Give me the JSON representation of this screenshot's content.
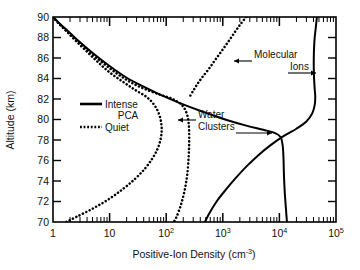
{
  "chart_data": {
    "type": "line",
    "title": "",
    "subtitle": "",
    "xlabel": "Positive-Ion Density (cm",
    "xlabel_unit_sup": "-3",
    "xlabel_tail": ")",
    "ylabel": "Altitude (km)",
    "xscale": "log",
    "yscale": "linear",
    "xlim": [
      1,
      100000
    ],
    "ylim": [
      70,
      90
    ],
    "grid": false,
    "xticks": [
      {
        "value": 1,
        "label": "1",
        "sup": ""
      },
      {
        "value": 10,
        "label": "10",
        "sup": ""
      },
      {
        "value": 100,
        "label": "10",
        "sup": "2"
      },
      {
        "value": 1000,
        "label": "10",
        "sup": "3"
      },
      {
        "value": 10000,
        "label": "10",
        "sup": "4"
      },
      {
        "value": 100000,
        "label": "10",
        "sup": "5"
      }
    ],
    "yticks": [
      {
        "value": 70,
        "label": "70"
      },
      {
        "value": 72,
        "label": "72"
      },
      {
        "value": 74,
        "label": "74"
      },
      {
        "value": 76,
        "label": "76"
      },
      {
        "value": 78,
        "label": "78"
      },
      {
        "value": 80,
        "label": "80"
      },
      {
        "value": 82,
        "label": "82"
      },
      {
        "value": 84,
        "label": "84"
      },
      {
        "value": 86,
        "label": "86"
      },
      {
        "value": 88,
        "label": "88"
      },
      {
        "value": 90,
        "label": "90"
      }
    ],
    "legend": {
      "position": "inside-left",
      "entries": [
        {
          "name": "Intense PCA",
          "line1": "Intense",
          "line2": "PCA",
          "style": "solid"
        },
        {
          "name": "Quiet",
          "line1": "Quiet",
          "line2": "",
          "style": "dotted"
        }
      ]
    },
    "annotations": [
      {
        "name": "Molecular Ions",
        "line1": "Molecular",
        "line2": "Ions"
      },
      {
        "name": "Water Clusters",
        "line1": "Water",
        "line2": "Clusters"
      }
    ],
    "series": [
      {
        "name": "Quiet - Water Clusters",
        "style": "dotted",
        "points": [
          [
            1.0,
            90.0
          ],
          [
            1.25,
            89.4
          ],
          [
            1.7,
            88.7
          ],
          [
            2.4,
            87.9
          ],
          [
            3.6,
            87.0
          ],
          [
            5.6,
            86.1
          ],
          [
            9.0,
            85.2
          ],
          [
            15.0,
            84.3
          ],
          [
            26.0,
            83.5
          ],
          [
            45.0,
            82.9
          ],
          [
            80.0,
            82.4
          ],
          [
            130.0,
            82.0
          ],
          [
            190.0,
            81.4
          ],
          [
            230.0,
            80.6
          ],
          [
            250.0,
            79.6
          ],
          [
            255.0,
            78.2
          ],
          [
            250.0,
            76.5
          ],
          [
            235.0,
            74.6
          ],
          [
            210.0,
            73.0
          ],
          [
            180.0,
            71.6
          ],
          [
            150.0,
            70.4
          ],
          [
            135.0,
            70.0
          ]
        ]
      },
      {
        "name": "Quiet - Molecular Ions",
        "style": "dotted",
        "points": [
          [
            1.0,
            90.0
          ],
          [
            1.3,
            89.3
          ],
          [
            1.8,
            88.5
          ],
          [
            2.6,
            87.6
          ],
          [
            4.0,
            86.6
          ],
          [
            6.2,
            85.6
          ],
          [
            10.0,
            84.6
          ],
          [
            17.0,
            83.7
          ],
          [
            28.0,
            82.9
          ],
          [
            45.0,
            82.2
          ],
          [
            62.0,
            81.4
          ],
          [
            75.0,
            80.5
          ],
          [
            82.0,
            79.6
          ],
          [
            83.0,
            78.8
          ],
          [
            79.0,
            78.0
          ],
          [
            70.0,
            77.1
          ],
          [
            57.0,
            76.2
          ],
          [
            42.0,
            75.2
          ],
          [
            28.0,
            74.2
          ],
          [
            17.0,
            73.2
          ],
          [
            9.5,
            72.2
          ],
          [
            5.0,
            71.3
          ],
          [
            2.6,
            70.5
          ],
          [
            1.7,
            70.0
          ]
        ]
      },
      {
        "name": "Quiet - Upper Molecular Ions",
        "style": "dotted",
        "points": [
          [
            2600.0,
            90.0
          ],
          [
            2050.0,
            89.3
          ],
          [
            1620.0,
            88.5
          ],
          [
            1250.0,
            87.6
          ],
          [
            960.0,
            86.7
          ],
          [
            730.0,
            85.8
          ],
          [
            560.0,
            84.9
          ],
          [
            430.0,
            84.1
          ],
          [
            350.0,
            83.4
          ],
          [
            300.0,
            82.8
          ],
          [
            265.0,
            82.3
          ]
        ]
      },
      {
        "name": "Intense PCA - Water Clusters",
        "style": "solid",
        "points": [
          [
            1.0,
            90.0
          ],
          [
            1.35,
            89.3
          ],
          [
            1.95,
            88.5
          ],
          [
            2.9,
            87.6
          ],
          [
            4.5,
            86.7
          ],
          [
            7.2,
            85.8
          ],
          [
            12.0,
            84.9
          ],
          [
            21.0,
            84.0
          ],
          [
            40.0,
            83.2
          ],
          [
            80.0,
            82.4
          ],
          [
            175.0,
            81.6
          ],
          [
            420.0,
            80.8
          ],
          [
            1100.0,
            80.0
          ],
          [
            2600.0,
            79.4
          ],
          [
            5200.0,
            79.0
          ],
          [
            8200.0,
            78.7
          ],
          [
            10500.0,
            78.3
          ],
          [
            11400.0,
            77.5
          ],
          [
            11800.0,
            76.3
          ],
          [
            12000.0,
            74.8
          ],
          [
            12400.0,
            73.0
          ],
          [
            13000.0,
            71.4
          ],
          [
            13600.0,
            70.0
          ]
        ]
      },
      {
        "name": "Intense PCA - Molecular Ions",
        "style": "solid",
        "points": [
          [
            46000.0,
            90.0
          ],
          [
            44000.0,
            89.0
          ],
          [
            42000.0,
            88.0
          ],
          [
            41000.0,
            87.0
          ],
          [
            40500.0,
            86.0
          ],
          [
            40500.0,
            85.0
          ],
          [
            41000.0,
            84.0
          ],
          [
            42000.0,
            83.0
          ],
          [
            43000.0,
            82.2
          ],
          [
            42000.0,
            81.4
          ],
          [
            38000.0,
            80.6
          ],
          [
            30000.0,
            79.8
          ],
          [
            20000.0,
            79.1
          ],
          [
            12000.0,
            78.4
          ],
          [
            7000.0,
            77.5
          ],
          [
            4200.0,
            76.5
          ],
          [
            2600.0,
            75.4
          ],
          [
            1700.0,
            74.3
          ],
          [
            1150.0,
            73.2
          ],
          [
            800.0,
            72.1
          ],
          [
            600.0,
            71.0
          ],
          [
            480.0,
            70.0
          ]
        ]
      }
    ]
  },
  "figure": {
    "background": "#ffffff",
    "line_color": "#000000",
    "frame_color": "#000000"
  }
}
